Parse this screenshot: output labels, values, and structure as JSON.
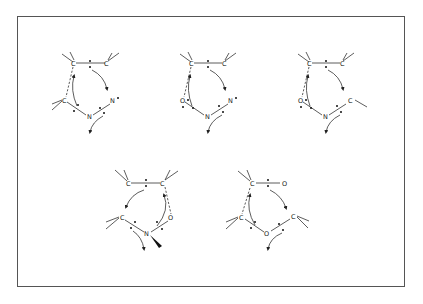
{
  "figure": {
    "border_color": "#555555",
    "structures": [
      {
        "id": "s1",
        "atoms": {
          "a1": "C",
          "a2": "C",
          "a3": "C",
          "a4": "N",
          "a5": "N"
        },
        "a5_charge_mark": "•"
      },
      {
        "id": "s2",
        "atoms": {
          "a1": "C",
          "a2": "C",
          "a3": "O",
          "a4": "N",
          "a5": "N"
        },
        "a5_charge_mark": "•"
      },
      {
        "id": "s3",
        "atoms": {
          "a1": "C",
          "a2": "C",
          "a3": "O",
          "a4": "N",
          "a5": "C"
        }
      },
      {
        "id": "s4",
        "atoms": {
          "a1": "C",
          "a2": "C",
          "a3": "C",
          "a4": "N",
          "a5": "O"
        }
      },
      {
        "id": "s5",
        "atoms": {
          "a1": "C",
          "a2": "O",
          "a3": "C",
          "a4": "O",
          "a5": "C"
        }
      }
    ]
  }
}
